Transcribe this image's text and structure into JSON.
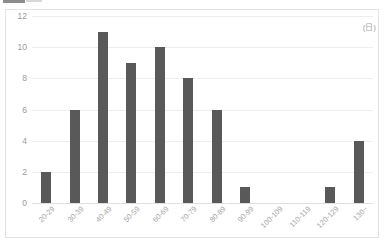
{
  "chart_data": {
    "type": "bar",
    "title": "",
    "subtitle": "",
    "xlabel": "",
    "ylabel": "",
    "unit_label": "(日)",
    "categories": [
      "20-29",
      "30-39",
      "40-49",
      "50-59",
      "60-69",
      "70-79",
      "80-89",
      "90-99",
      "100-109",
      "110-119",
      "120-129",
      "130~"
    ],
    "values": [
      2,
      6,
      11,
      9,
      10,
      8,
      6,
      1,
      0,
      0,
      1,
      4
    ],
    "ylim": [
      0,
      12
    ],
    "y_ticks": [
      "0",
      "2",
      "4",
      "6",
      "8",
      "10",
      "12"
    ],
    "y_tick_values": [
      0,
      2,
      4,
      6,
      8,
      10,
      12
    ],
    "grid": "horizontal",
    "legend": "none",
    "bar_color": "#595959",
    "gridline_color": "#eeeeee",
    "axis_text_color": "#a6a6a6",
    "background_color": "#ffffff",
    "frame_color": "#e3e3e3"
  }
}
